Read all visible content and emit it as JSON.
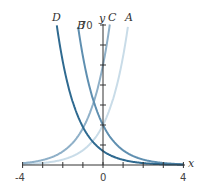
{
  "chart_data": {
    "type": "line",
    "title": "",
    "xlabel": "x",
    "ylabel": "y",
    "xlim": [
      -4,
      4
    ],
    "ylim": [
      0,
      70
    ],
    "x_ticks": [
      "-4",
      "0",
      "4"
    ],
    "y_ticks": [
      "70"
    ],
    "grid": false,
    "series": [
      {
        "name": "A",
        "formula": "20e^x",
        "color": "#c9dce8",
        "x": [
          -4,
          -3,
          -2,
          -1,
          0,
          1,
          1.25
        ],
        "values": [
          0.4,
          1.0,
          2.7,
          7.4,
          20,
          54.4,
          70
        ]
      },
      {
        "name": "B",
        "formula": "20e^-x",
        "color": "#5f8fb0",
        "x": [
          -1.25,
          -1,
          0,
          1,
          2,
          3,
          4
        ],
        "values": [
          70,
          54.4,
          20,
          7.4,
          2.7,
          1.0,
          0.4
        ]
      },
      {
        "name": "C",
        "formula": "50e^x",
        "color": "#8fb0c8",
        "x": [
          -4,
          -3,
          -2,
          -1,
          0,
          0.34
        ],
        "values": [
          0.9,
          2.5,
          6.8,
          18.4,
          50,
          70
        ]
      },
      {
        "name": "D",
        "formula": "7e^-x",
        "color": "#2f6a90",
        "x": [
          -2.3,
          -2,
          -1,
          0,
          1,
          2,
          3,
          4
        ],
        "values": [
          70,
          51.7,
          19,
          7,
          2.6,
          0.9,
          0.35,
          0.13
        ]
      }
    ]
  },
  "labels": {
    "A": "A",
    "B": "B",
    "C": "C",
    "D": "D",
    "x": "x",
    "y": "y",
    "y_max": "70",
    "x_min": "-4",
    "x_zero": "0",
    "x_max": "4"
  }
}
